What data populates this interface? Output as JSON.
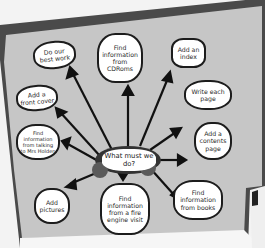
{
  "diagram": {
    "type": "mind-map poster",
    "center": {
      "label": "What must we do?"
    },
    "nodes": [
      {
        "id": "best-work",
        "label": "Do our best work"
      },
      {
        "id": "cdroms",
        "label": "Find information from CDRoms"
      },
      {
        "id": "index",
        "label": "Add an index"
      },
      {
        "id": "write-page",
        "label": "Write each page"
      },
      {
        "id": "contents",
        "label": "Add a contents page"
      },
      {
        "id": "books",
        "label": "Find information from books"
      },
      {
        "id": "fire-engine",
        "label": "Find information from a fire engine visit"
      },
      {
        "id": "pictures",
        "label": "Add pictures"
      },
      {
        "id": "mrs-holden",
        "label": "Find information from talking to Mrs Holden"
      },
      {
        "id": "front-cover",
        "label": "Add a front cover"
      }
    ],
    "colors": {
      "board": "#c9c9c9",
      "border": "#4a4a4a",
      "arrows": "#111111",
      "bubble": "#ffffff",
      "center_blob": "#3a3a3a"
    }
  }
}
